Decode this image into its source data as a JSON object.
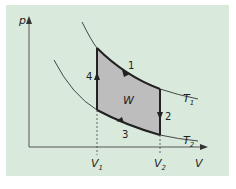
{
  "diagram": {
    "type": "p-V diagram (Carnot-like cycle)",
    "axes": {
      "y_label": "p",
      "x_label": "V"
    },
    "x_ticks": [
      {
        "label": "V",
        "sub": "1"
      },
      {
        "label": "V",
        "sub": "2"
      }
    ],
    "isotherms": [
      {
        "label": "T",
        "sub": "1"
      },
      {
        "label": "T",
        "sub": "2"
      }
    ],
    "region_label": "W",
    "steps": [
      "1",
      "2",
      "3",
      "4"
    ],
    "colors": {
      "background": "#d9eadc",
      "fill": "#bdbdbd",
      "line": "#222222"
    }
  }
}
